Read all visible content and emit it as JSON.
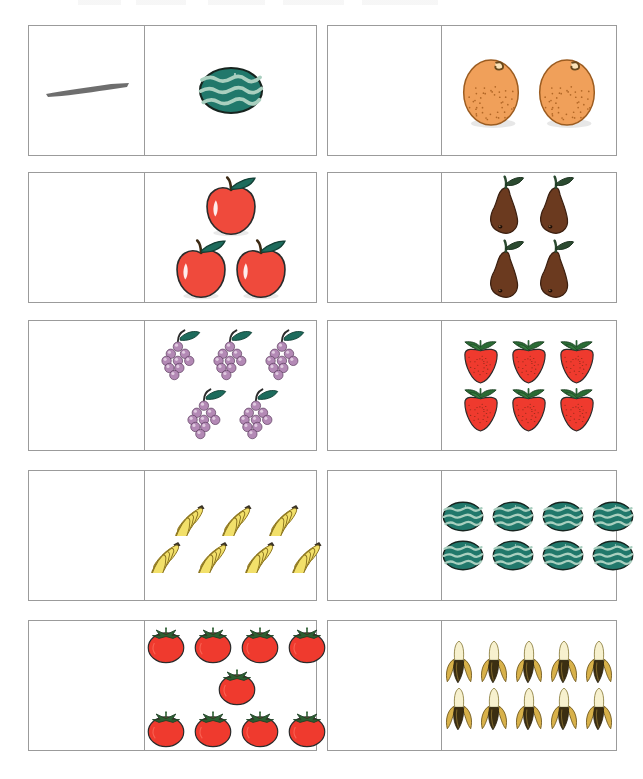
{
  "worksheet": {
    "title": "Counting fruit worksheet",
    "columns": [
      "answer",
      "picture"
    ],
    "grid": {
      "rows": 5,
      "cols": 2,
      "cell_count": 10
    },
    "colors": {
      "border": "#9b9b9b",
      "background": "#ffffff",
      "pencil_mark": "#5a5a5a",
      "watermelon_body": "#21786b",
      "watermelon_stripe": "#a9cfbf",
      "orange_body": "#f0a05a",
      "orange_stem": "#6b4a1c",
      "apple_body": "#ef4a3c",
      "apple_leaf": "#1d6b5c",
      "pear_body": "#6b3a1f",
      "pear_leaf": "#2b4a30",
      "grape_body": "#b389b5",
      "grape_leaf": "#1d6b5c",
      "strawberry_body": "#ef3a2e",
      "strawberry_leaf": "#2a6b34",
      "banana_body": "#f2e06a",
      "banana_stem": "#3a3326",
      "tomato_body": "#ef3a2e",
      "tomato_leaf": "#2d5f32",
      "peeled_banana_flesh": "#f7f1cf",
      "peeled_banana_peel": "#d8b14a"
    },
    "cells": [
      {
        "index": 1,
        "position": "row1-left",
        "fruit": "watermelon",
        "fruit_label": "watermelon",
        "count": 1,
        "answer": "—",
        "answer_filled": true,
        "answer_type": "pencil-dash",
        "layout": [
          1
        ]
      },
      {
        "index": 2,
        "position": "row1-right",
        "fruit": "orange",
        "fruit_label": "orange",
        "count": 2,
        "answer": "",
        "answer_filled": false,
        "answer_type": "blank",
        "layout": [
          2
        ]
      },
      {
        "index": 3,
        "position": "row2-left",
        "fruit": "apple",
        "fruit_label": "apple",
        "count": 3,
        "answer": "",
        "answer_filled": false,
        "answer_type": "blank",
        "layout": [
          1,
          2
        ]
      },
      {
        "index": 4,
        "position": "row2-right",
        "fruit": "pear",
        "fruit_label": "pear",
        "count": 4,
        "answer": "",
        "answer_filled": false,
        "answer_type": "blank",
        "layout": [
          2,
          2
        ]
      },
      {
        "index": 5,
        "position": "row3-left",
        "fruit": "grapes",
        "fruit_label": "bunch of grapes",
        "count": 5,
        "answer": "",
        "answer_filled": false,
        "answer_type": "blank",
        "layout": [
          3,
          2
        ]
      },
      {
        "index": 6,
        "position": "row3-right",
        "fruit": "strawberry",
        "fruit_label": "strawberry",
        "count": 6,
        "answer": "",
        "answer_filled": false,
        "answer_type": "blank",
        "layout": [
          3,
          3
        ]
      },
      {
        "index": 7,
        "position": "row4-left",
        "fruit": "bananas",
        "fruit_label": "bunch of bananas",
        "count": 7,
        "answer": "",
        "answer_filled": false,
        "answer_type": "blank",
        "layout": [
          3,
          4
        ]
      },
      {
        "index": 8,
        "position": "row4-right",
        "fruit": "watermelon",
        "fruit_label": "watermelon",
        "count": 8,
        "answer": "",
        "answer_filled": false,
        "answer_type": "blank",
        "layout": [
          4,
          4
        ]
      },
      {
        "index": 9,
        "position": "row5-left",
        "fruit": "tomato",
        "fruit_label": "tomato",
        "count": 9,
        "answer": "",
        "answer_filled": false,
        "answer_type": "blank",
        "layout": [
          4,
          1,
          4
        ]
      },
      {
        "index": 10,
        "position": "row5-right",
        "fruit": "peeled-banana",
        "fruit_label": "peeled banana",
        "count": 10,
        "answer": "",
        "answer_filled": false,
        "answer_type": "blank",
        "layout": [
          5,
          5
        ]
      }
    ]
  }
}
